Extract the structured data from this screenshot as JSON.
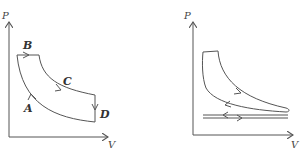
{
  "diagrams": [
    {
      "id": "left",
      "axes": {
        "y_label": "P",
        "x_label": "V"
      },
      "points": [
        {
          "label": "B"
        },
        {
          "label": "C"
        },
        {
          "label": "A"
        },
        {
          "label": "D"
        }
      ],
      "description": "Closed P-V cycle: isobaric expansion at B, expansion curve through C, isochoric drop at D, compression curve through A back to start"
    },
    {
      "id": "right",
      "axes": {
        "y_label": "P",
        "x_label": "V"
      },
      "description": "Engine indicator P-V loop with power loop and lower pumping loop (two near-horizontal lines with opposite arrows)"
    }
  ],
  "colors": {
    "stroke": "#555555",
    "label": "#333333",
    "background": "#ffffff"
  }
}
